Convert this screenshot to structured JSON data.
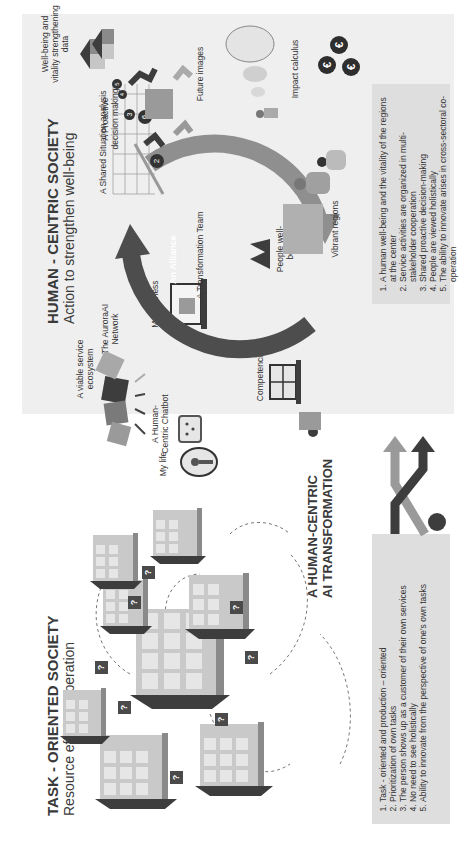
{
  "left": {
    "title": "TASK - ORIENTED SOCIETY",
    "subtitle": "Resource efficient operation",
    "list": [
      "Task - oriented and production – oriented",
      "Prioritization of own tasks",
      "The person shows up as a customer of their own services",
      "No need to see holistically",
      "Ability to innovate from the perspective of one's own tasks"
    ],
    "question_mark": "?"
  },
  "middle": {
    "title_line1": "A HUMAN-CENTRIC",
    "title_line2": "AI TRANSFORMATION"
  },
  "right": {
    "title": "HUMAN - CENTRIC SOCIETY",
    "subtitle": "Action to strengthen well-being",
    "labels": {
      "viable_service": "A viable service ecosystem",
      "aurora_network": "The AuroraAI Network",
      "chatbot": "A Human-Centric Chatbot",
      "my_life": "My life",
      "my_business": "My business",
      "competencies": "Competencies",
      "shared_situation": "A Shared Situation analysis",
      "alliance": "An Alliance",
      "transformation_team": "A Transformation Team",
      "people_wellbeing": "People well-being",
      "vibrant_regions": "Vibrant regions",
      "wellbeing_data": "Well-being and vitality strengthening data",
      "proactive_decision": "A Proactive decision making",
      "future_images": "Future images",
      "impact_calculus": "Impact calculus"
    },
    "grid_badges": [
      "5",
      "4",
      "3",
      "6",
      "2"
    ],
    "list": [
      "A human well-being and the vitality of the regions at the center",
      "Service activities are organized in multi-stakeholder cooperation",
      "Shared proactive decision-making",
      "People are viewed holistically",
      "The ability to innovate arises in cross-sectoral co-operation"
    ],
    "euro_symbol": "€"
  },
  "colors": {
    "dark": "#3d3d3d",
    "mid": "#8a8a8a",
    "light": "#bdbdbd",
    "panel": "#efefef",
    "listbox": "#dedede"
  }
}
